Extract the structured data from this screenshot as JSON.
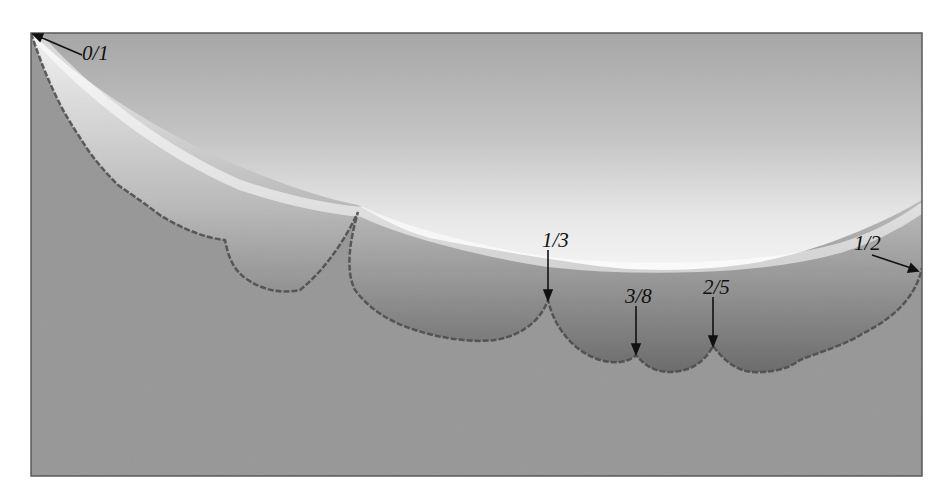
{
  "figure": {
    "type": "fractal-boundary-diagram",
    "background_color": "#9a9a9a",
    "highlight_color": "#f4f4f4",
    "frame_color": "#555555",
    "labels": [
      {
        "id": "0-1",
        "text": "0/1",
        "x": 82,
        "y": 60
      },
      {
        "id": "1-3",
        "text": "1/3",
        "x": 542,
        "y": 247
      },
      {
        "id": "3-8",
        "text": "3/8",
        "x": 628,
        "y": 303
      },
      {
        "id": "2-5",
        "text": "2/5",
        "x": 706,
        "y": 294
      },
      {
        "id": "1-2",
        "text": "1/2",
        "x": 856,
        "y": 249
      }
    ]
  }
}
